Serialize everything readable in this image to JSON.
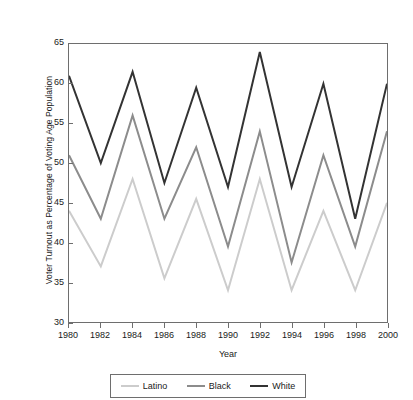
{
  "chart_data": {
    "type": "line",
    "title": "",
    "xlabel": "Year",
    "ylabel": "Voter Turnout as Percentage of Voting Age Population",
    "x": [
      1980,
      1982,
      1984,
      1986,
      1988,
      1990,
      1992,
      1994,
      1996,
      1998,
      2000
    ],
    "categories": [
      "1980",
      "1982",
      "1984",
      "1986",
      "1988",
      "1990",
      "1992",
      "1994",
      "1996",
      "1998",
      "2000"
    ],
    "xlim": [
      1980,
      2000
    ],
    "ylim": [
      30,
      65
    ],
    "xticks": [
      "1980",
      "1982",
      "1984",
      "1986",
      "1988",
      "1990",
      "1992",
      "1994",
      "1996",
      "1998",
      "2000"
    ],
    "yticks": [
      "65",
      "60",
      "55",
      "50",
      "45",
      "40",
      "35",
      "30"
    ],
    "grid": false,
    "legend_position": "bottom",
    "series": [
      {
        "name": "Latino",
        "color": "#cccccc",
        "values": [
          44.0,
          37.0,
          48.0,
          35.5,
          45.5,
          34.0,
          48.0,
          34.0,
          44.0,
          34.0,
          45.0
        ]
      },
      {
        "name": "Black",
        "color": "#8c8c8c",
        "values": [
          51.0,
          43.0,
          56.0,
          43.0,
          52.0,
          39.5,
          54.0,
          37.5,
          51.0,
          39.5,
          54.0
        ]
      },
      {
        "name": "White",
        "color": "#333333",
        "values": [
          61.0,
          50.0,
          61.5,
          47.5,
          59.5,
          47.0,
          64.0,
          47.0,
          60.0,
          43.0,
          60.0
        ]
      }
    ]
  },
  "legend": {
    "entries": [
      {
        "label": "Latino",
        "color": "#cccccc"
      },
      {
        "label": "Black",
        "color": "#8c8c8c"
      },
      {
        "label": "White",
        "color": "#333333"
      }
    ]
  }
}
